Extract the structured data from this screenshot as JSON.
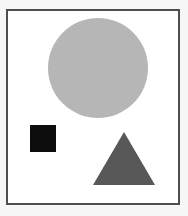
{
  "canvas": {
    "width": 188,
    "height": 216,
    "background_color": "#f6f6f6"
  },
  "frame": {
    "border_color": "#4e4e52",
    "border_width": 2,
    "fill_color": "#ffffff",
    "x": 6,
    "y": 9,
    "width": 174,
    "height": 196
  },
  "shapes": [
    {
      "id": "circle",
      "kind": "circle",
      "label": "large light gray circle",
      "color": "#b6b6b6",
      "center_x": 98,
      "center_y": 68,
      "diameter": 100,
      "radius": 50
    },
    {
      "id": "square",
      "kind": "square",
      "label": "small black square",
      "color": "#0d0d0d",
      "x": 30,
      "y": 125,
      "width": 26,
      "height": 27
    },
    {
      "id": "triangle",
      "kind": "triangle",
      "label": "dark gray triangle",
      "color": "#585858",
      "apex_x": 124,
      "apex_y": 132,
      "base_left_x": 93,
      "base_right_x": 155,
      "base_y": 185,
      "points": "31,0 62,53 0,53"
    }
  ],
  "chart_data": {
    "type": "scatter",
    "title": "",
    "xlabel": "",
    "ylabel": "",
    "xlim": [
      0,
      174
    ],
    "ylim": [
      0,
      196
    ],
    "grid": false,
    "legend": "none",
    "series": [
      {
        "name": "circle",
        "marker": "circle",
        "color": "#b6b6b6",
        "x": [
          98
        ],
        "y": [
          68
        ],
        "size": [
          100
        ]
      },
      {
        "name": "square",
        "marker": "square",
        "color": "#0d0d0d",
        "x": [
          43
        ],
        "y": [
          138
        ],
        "size": [
          26
        ]
      },
      {
        "name": "triangle",
        "marker": "triangle",
        "color": "#585858",
        "x": [
          124
        ],
        "y": [
          167
        ],
        "size": [
          62
        ]
      }
    ]
  }
}
